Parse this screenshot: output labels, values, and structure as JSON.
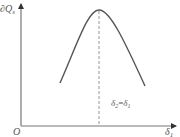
{
  "diagram": {
    "y_axis_label": "∂Q",
    "y_axis_label_sub": "s",
    "x_axis_label": "δ",
    "x_axis_label_sub": "1",
    "origin_label": "O",
    "peak_annotation_left": "δ",
    "peak_annotation_left_sub": "2",
    "peak_annotation_eq": "=",
    "peak_annotation_right": "δ",
    "peak_annotation_right_sub": "1",
    "curve_shape": "inverted parabola with maximum at δ2 = δ1",
    "colors": {
      "axis": "#666666",
      "curve": "#555555",
      "dashed": "#888888",
      "text": "#555555"
    }
  }
}
